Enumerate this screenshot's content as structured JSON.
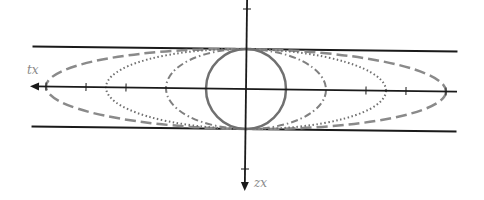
{
  "diagram": {
    "width": 484,
    "height": 200,
    "rotation_deg": 0.7,
    "origin": {
      "x": 246,
      "y": 89
    },
    "labels": {
      "horizontal_axis": "tx",
      "vertical_axis": "zx"
    },
    "boundary_lines": {
      "half_height": 40,
      "x_start": 32,
      "x_end": 457,
      "color": "#1a1a1a"
    },
    "axes": {
      "horizontal": {
        "x_start": 31,
        "x_end": 457,
        "arrow": "left"
      },
      "vertical": {
        "y_start": 0,
        "y_end": 190,
        "arrow": "down"
      },
      "horizontal_ticks": [
        -160,
        -120,
        120,
        160
      ],
      "vertical_ticks": [
        -80,
        80
      ],
      "color": "#1a1a1a"
    },
    "curves": [
      {
        "name": "circle",
        "style": "solid",
        "rx": 40,
        "ry": 40,
        "color": "#707070"
      },
      {
        "name": "dash-dot-ellipse",
        "style": "dash-dot",
        "rx": 80,
        "ry": 40,
        "color": "#808080"
      },
      {
        "name": "dotted-ellipse",
        "style": "dotted",
        "rx": 140,
        "ry": 40,
        "color": "#707070"
      },
      {
        "name": "dashed-ellipse",
        "style": "dashed",
        "rx": 200,
        "ry": 40,
        "color": "#8a8a8a"
      }
    ]
  }
}
